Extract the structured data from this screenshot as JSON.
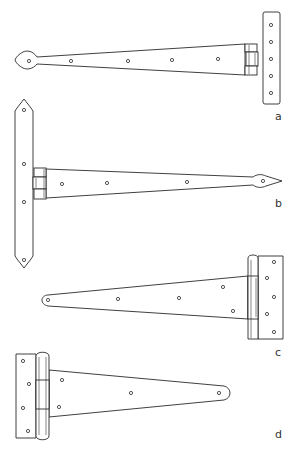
{
  "figure": {
    "background": "#ffffff",
    "stroke_color": "#2a2a2a"
  },
  "hinges": [
    {
      "id": "a",
      "label": "a",
      "style": "heart-ended strap with rectangular leaf",
      "strap_holes": 5,
      "leaf_holes": 5
    },
    {
      "id": "b",
      "label": "b",
      "style": "spear-ended strap with pointed long leaf",
      "strap_holes": 4,
      "leaf_holes": 4
    },
    {
      "id": "c",
      "label": "c",
      "style": "tapered strap with round end and rectangular leaf",
      "strap_holes": 5,
      "leaf_holes": 5
    },
    {
      "id": "d",
      "label": "d",
      "style": "tapered strap with round end and rectangular leaf (reversed)",
      "strap_holes": 4,
      "leaf_holes": 4
    }
  ]
}
